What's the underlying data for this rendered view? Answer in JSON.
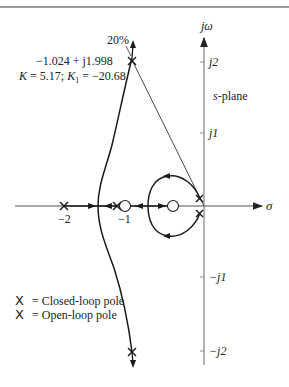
{
  "diagram": {
    "type": "root-locus",
    "plane_label": "s-plane",
    "axes": {
      "real_axis_label": "σ",
      "imag_axis_label": "jω",
      "real_ticks": [
        "−2",
        "−1"
      ],
      "imag_ticks": [
        "j2",
        "j1",
        "−j1",
        "−j2"
      ]
    },
    "annotation": {
      "percent_overshoot": "20%",
      "pole_value": "−1.024 + j1.998",
      "gains": "K = 5.17; K",
      "gains_sub": "1",
      "gains_tail": " = −20.68"
    },
    "legend": [
      {
        "marker": "X",
        "label": "= Closed-loop pole"
      },
      {
        "marker": "X",
        "label": "= Open-loop pole"
      }
    ],
    "colors": {
      "axis": "#8a8a8a",
      "locus": "#1a1a1a",
      "text": "#222222",
      "top_rule": "#7a7a7a"
    }
  }
}
